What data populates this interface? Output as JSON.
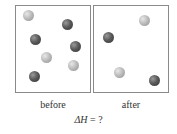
{
  "panels": [
    {
      "label": "before",
      "balls": [
        {
          "type": "light",
          "x": 28,
          "y": 15
        },
        {
          "type": "dark",
          "x": 67,
          "y": 24
        },
        {
          "type": "dark",
          "x": 35,
          "y": 39
        },
        {
          "type": "dark",
          "x": 75,
          "y": 46
        },
        {
          "type": "light",
          "x": 46,
          "y": 57
        },
        {
          "type": "light",
          "x": 73,
          "y": 65
        },
        {
          "type": "dark",
          "x": 34,
          "y": 76
        }
      ]
    },
    {
      "label": "after",
      "balls": [
        {
          "type": "light",
          "x": 144,
          "y": 20
        },
        {
          "type": "dark",
          "x": 108,
          "y": 37
        },
        {
          "type": "light",
          "x": 119,
          "y": 72
        },
        {
          "type": "dark",
          "x": 154,
          "y": 80
        }
      ]
    }
  ],
  "equation": {
    "symbol": "ΔH",
    "rest": " = ?"
  }
}
